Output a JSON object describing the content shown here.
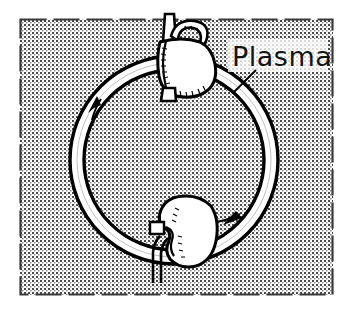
{
  "figure": {
    "kind": "line-drawing",
    "panel": {
      "border_style": "dashed",
      "border_color": "#3a3a3a",
      "fill_pattern": "halftone-dots",
      "fill_base_color": "#ffffff",
      "dot_color": "#4a4a4a",
      "bounds": {
        "x": 20,
        "y": 19,
        "width": 313,
        "height": 276
      }
    },
    "annotations": [
      {
        "name": "plasma-label",
        "text": "Plasma",
        "x": 232,
        "y": 64,
        "color": "#141414",
        "leader_line": {
          "from_x": 255,
          "from_y": 70,
          "to_x": 234,
          "to_y": 92
        }
      }
    ],
    "shapes": [
      {
        "name": "circulation-ring",
        "kind": "annulus",
        "center_x": 174,
        "center_y": 160,
        "outer_radius": 104,
        "inner_radius": 90,
        "stroke_color": "#000000",
        "fill_color": "#ffffff",
        "flow_direction": "clockwise"
      },
      {
        "name": "heart-organ",
        "kind": "organ",
        "center_x": 181,
        "center_y": 58,
        "stroke_color": "#000000",
        "fill_color": "#ffffff"
      },
      {
        "name": "kidney-organ",
        "kind": "organ",
        "center_x": 182,
        "center_y": 229,
        "stroke_color": "#000000",
        "fill_color": "#ffffff"
      }
    ],
    "flow_arrows": [
      {
        "name": "flow-arrow-left",
        "x": 96,
        "y": 100,
        "points": "up-right"
      },
      {
        "name": "flow-arrow-right",
        "x": 235,
        "y": 219,
        "points": "down-left"
      }
    ],
    "colors": {
      "ink": "#000000",
      "panel_dot": "#4a4a4a",
      "paper": "#ffffff",
      "border": "#3a3a3a"
    }
  }
}
